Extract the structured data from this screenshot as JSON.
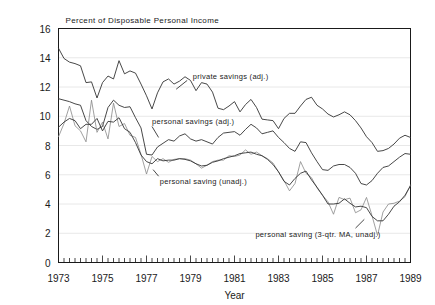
{
  "chart_data": {
    "type": "line",
    "title": "Percent of Disposable Personal Income",
    "xlabel": "Year",
    "ylabel": "",
    "xlim": [
      1973.0,
      1989.0
    ],
    "ylim": [
      0,
      16
    ],
    "grid": "horizontal-faint",
    "legend": "inline-annotations",
    "x_ticks": [
      1973,
      1975,
      1977,
      1979,
      1981,
      1983,
      1985,
      1987,
      1989
    ],
    "x_tick_labels": [
      "1973",
      "1975",
      "1977",
      "1979",
      "1981",
      "1983",
      "1985",
      "1987",
      "1989"
    ],
    "x_minor_tick_step": 0.25,
    "y_ticks": [
      0,
      2,
      4,
      6,
      8,
      10,
      12,
      14,
      16
    ],
    "y_tick_labels": [
      "0",
      "2",
      "4",
      "6",
      "8",
      "10",
      "12",
      "14",
      "16"
    ],
    "x": [
      1973.0,
      1973.25,
      1973.5,
      1973.75,
      1974.0,
      1974.25,
      1974.5,
      1974.75,
      1975.0,
      1975.25,
      1975.5,
      1975.75,
      1976.0,
      1976.25,
      1976.5,
      1976.75,
      1977.0,
      1977.25,
      1977.5,
      1977.75,
      1978.0,
      1978.25,
      1978.5,
      1978.75,
      1979.0,
      1979.25,
      1979.5,
      1979.75,
      1980.0,
      1980.25,
      1980.5,
      1980.75,
      1981.0,
      1981.25,
      1981.5,
      1981.75,
      1982.0,
      1982.25,
      1982.5,
      1982.75,
      1983.0,
      1983.25,
      1983.5,
      1983.75,
      1984.0,
      1984.25,
      1984.5,
      1984.75,
      1985.0,
      1985.25,
      1985.5,
      1985.75,
      1986.0,
      1986.25,
      1986.5,
      1986.75,
      1987.0,
      1987.25,
      1987.5,
      1987.75,
      1988.0,
      1988.25,
      1988.5,
      1988.75,
      1989.0
    ],
    "series": [
      {
        "name": "private savings (adj.)",
        "label_x": 1979.1,
        "label_y": 12.75,
        "leader_from": [
          1978.85,
          12.45
        ],
        "leader_to": [
          1978.35,
          11.85
        ],
        "values": [
          14.65,
          13.95,
          13.7,
          13.6,
          13.45,
          12.3,
          12.35,
          11.25,
          12.3,
          12.75,
          12.55,
          13.8,
          12.9,
          13.1,
          12.95,
          12.2,
          11.4,
          10.5,
          11.6,
          12.35,
          12.55,
          12.2,
          12.4,
          12.7,
          12.45,
          11.75,
          12.3,
          12.2,
          11.65,
          10.55,
          10.45,
          10.7,
          11.0,
          10.3,
          10.8,
          11.15,
          10.6,
          9.8,
          9.75,
          9.7,
          9.15,
          9.85,
          10.2,
          10.2,
          10.7,
          11.15,
          11.3,
          10.75,
          10.5,
          10.15,
          9.95,
          10.1,
          10.3,
          10.1,
          9.7,
          9.2,
          8.6,
          8.2,
          7.6,
          7.65,
          7.8,
          8.1,
          8.5,
          8.7,
          8.55
        ]
      },
      {
        "name": "personal savings (adj.)",
        "label_x": 1977.25,
        "label_y": 9.65,
        "leader_from": [
          1977.25,
          9.3
        ],
        "leader_to": [
          1977.55,
          8.55
        ],
        "values": [
          11.2,
          11.1,
          11.0,
          10.85,
          10.75,
          9.7,
          9.3,
          9.1,
          9.3,
          10.6,
          11.1,
          10.75,
          10.6,
          10.65,
          9.9,
          9.2,
          7.4,
          7.35,
          7.9,
          8.15,
          8.4,
          8.3,
          8.65,
          8.8,
          8.45,
          8.3,
          8.4,
          8.25,
          8.1,
          8.55,
          8.85,
          8.9,
          8.95,
          8.7,
          9.1,
          9.45,
          9.2,
          8.8,
          8.9,
          9.0,
          8.55,
          8.2,
          7.8,
          7.6,
          8.25,
          8.2,
          7.5,
          6.9,
          6.35,
          6.3,
          6.6,
          6.7,
          6.7,
          6.5,
          6.1,
          5.4,
          5.3,
          5.6,
          6.1,
          6.5,
          6.6,
          6.9,
          7.2,
          7.45,
          7.4
        ]
      },
      {
        "name": "personal saving (unadj.)",
        "label_x": 1977.6,
        "label_y": 5.55,
        "leader_from": [
          1977.55,
          5.9
        ],
        "leader_to": [
          1977.3,
          6.35
        ],
        "values": [
          8.6,
          9.5,
          10.7,
          9.35,
          9.0,
          8.25,
          11.1,
          8.9,
          9.6,
          8.45,
          10.9,
          9.3,
          9.5,
          8.7,
          8.55,
          7.4,
          6.05,
          7.25,
          6.9,
          7.1,
          6.85,
          7.05,
          7.1,
          7.1,
          7.0,
          6.75,
          6.45,
          6.65,
          6.9,
          7.0,
          7.0,
          7.3,
          7.25,
          7.35,
          7.7,
          7.4,
          7.55,
          7.3,
          7.1,
          6.8,
          6.2,
          5.6,
          4.9,
          5.4,
          6.9,
          6.1,
          5.8,
          5.1,
          4.6,
          4.15,
          3.3,
          4.45,
          4.3,
          4.4,
          3.4,
          3.6,
          4.45,
          3.2,
          1.85,
          3.45,
          4.0,
          4.05,
          4.2,
          4.5,
          5.3
        ]
      },
      {
        "name": "personal saving (3-qtr. MA, unadj.)",
        "label_x": 1981.95,
        "label_y": 1.95,
        "leader_from": [
          1986.5,
          2.35
        ],
        "leader_to": [
          1986.9,
          2.95
        ],
        "values": [
          9.25,
          9.6,
          9.85,
          9.7,
          9.15,
          9.45,
          9.45,
          9.85,
          9.0,
          9.65,
          9.6,
          9.9,
          9.15,
          8.9,
          8.2,
          7.35,
          6.9,
          6.75,
          7.1,
          6.95,
          7.0,
          7.0,
          7.1,
          7.05,
          6.95,
          6.75,
          6.6,
          6.65,
          6.85,
          6.95,
          7.1,
          7.2,
          7.3,
          7.45,
          7.5,
          7.55,
          7.4,
          7.3,
          7.05,
          6.7,
          6.2,
          5.55,
          5.3,
          5.75,
          6.1,
          6.25,
          5.65,
          5.15,
          4.6,
          4.0,
          4.0,
          4.05,
          4.35,
          4.05,
          3.8,
          3.85,
          3.75,
          3.15,
          2.85,
          2.85,
          3.3,
          3.85,
          4.15,
          4.6,
          5.25
        ]
      }
    ]
  },
  "labels": {
    "title": "Percent of Disposable Personal Income",
    "xlabel": "Year",
    "annotation_private": "private savings (adj.)",
    "annotation_personal_adj": "personal savings (adj.)",
    "annotation_personal_unadj": "personal saving (unadj.)",
    "annotation_personal_ma": "personal saving (3-qtr. MA, unadj.)"
  },
  "colors": {
    "ink": "#1a1a1a",
    "line_dark": "#333333",
    "line_light": "#888888",
    "grid": "#e8e8e8",
    "background": "#ffffff"
  }
}
